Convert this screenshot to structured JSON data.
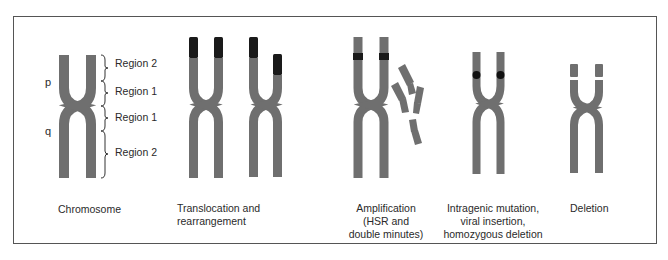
{
  "figure": {
    "colors": {
      "chromosome": "#6f6f6f",
      "marker": "#1a1a1a",
      "border": "#555555",
      "text": "#2a2a2a"
    },
    "arm_labels": {
      "p": "p",
      "q": "q"
    },
    "regions": [
      {
        "label": "Region 2",
        "arm": "p"
      },
      {
        "label": "Region 1",
        "arm": "p"
      },
      {
        "label": "Region 1",
        "arm": "q"
      },
      {
        "label": "Region 2",
        "arm": "q"
      }
    ],
    "panels": [
      {
        "id": "chromosome",
        "caption": [
          "Chromosome"
        ]
      },
      {
        "id": "translocation",
        "caption": [
          "Translocation and",
          "rearrangement"
        ]
      },
      {
        "id": "amplification",
        "caption": [
          "Amplification",
          "(HSR and",
          "double minutes)"
        ]
      },
      {
        "id": "intragenic",
        "caption": [
          "Intragenic mutation,",
          "viral insertion,",
          "homozygous deletion"
        ]
      },
      {
        "id": "deletion",
        "caption": [
          "Deletion"
        ]
      }
    ]
  }
}
